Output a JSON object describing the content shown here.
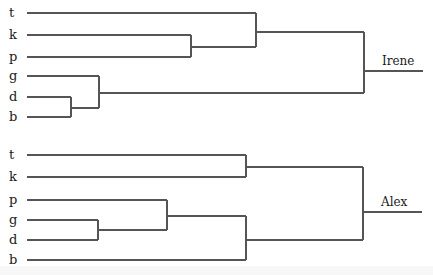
{
  "diagram": {
    "type": "dendrogram",
    "colors": {
      "line": "#555555",
      "text": "#1a1a1a",
      "background": "#ffffff"
    },
    "trees": [
      {
        "name": "Irene",
        "label_pos": [
          382,
          65
        ],
        "leaves": [
          {
            "label": "t",
            "y": 13
          },
          {
            "label": "k",
            "y": 35
          },
          {
            "label": "p",
            "y": 57
          },
          {
            "label": "g",
            "y": 76
          },
          {
            "label": "d",
            "y": 97
          },
          {
            "label": "b",
            "y": 117
          }
        ],
        "leaf_start_x": 27,
        "segments": [
          [
            27,
            13,
            256,
            13
          ],
          [
            27,
            35,
            191,
            35
          ],
          [
            27,
            57,
            191,
            57
          ],
          [
            191,
            35,
            191,
            57
          ],
          [
            191,
            47,
            256,
            47
          ],
          [
            256,
            13,
            256,
            47
          ],
          [
            256,
            32,
            364,
            32
          ],
          [
            27,
            76,
            99,
            76
          ],
          [
            27,
            97,
            71,
            97
          ],
          [
            27,
            117,
            71,
            117
          ],
          [
            71,
            97,
            71,
            117
          ],
          [
            71,
            108,
            99,
            108
          ],
          [
            99,
            76,
            99,
            108
          ],
          [
            99,
            93,
            364,
            93
          ],
          [
            364,
            32,
            364,
            93
          ],
          [
            364,
            71,
            423,
            71
          ]
        ],
        "clusters": [
          "((t,(k,p)),(g,(d,b)))"
        ]
      },
      {
        "name": "Alex",
        "label_pos": [
          381,
          206
        ],
        "leaves": [
          {
            "label": "t",
            "y": 155
          },
          {
            "label": "k",
            "y": 177
          },
          {
            "label": "p",
            "y": 200
          },
          {
            "label": "g",
            "y": 220
          },
          {
            "label": "d",
            "y": 240
          },
          {
            "label": "b",
            "y": 260
          }
        ],
        "leaf_start_x": 27,
        "segments": [
          [
            27,
            155,
            246,
            155
          ],
          [
            27,
            177,
            246,
            177
          ],
          [
            246,
            155,
            246,
            177
          ],
          [
            246,
            167,
            363,
            167
          ],
          [
            27,
            200,
            167,
            200
          ],
          [
            27,
            220,
            98,
            220
          ],
          [
            27,
            240,
            98,
            240
          ],
          [
            98,
            220,
            98,
            240
          ],
          [
            98,
            230,
            167,
            230
          ],
          [
            167,
            200,
            167,
            230
          ],
          [
            167,
            216,
            246,
            216
          ],
          [
            27,
            260,
            246,
            260
          ],
          [
            246,
            216,
            246,
            260
          ],
          [
            246,
            240,
            363,
            240
          ],
          [
            363,
            167,
            363,
            240
          ],
          [
            363,
            212,
            422,
            212
          ]
        ],
        "clusters": [
          "((t,k),((p,(g,d)),b))"
        ]
      }
    ]
  }
}
